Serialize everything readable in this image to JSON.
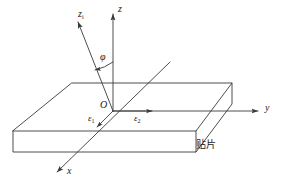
{
  "figure": {
    "kind": "3d-coordinate-slab-diagram",
    "background_color": "#ffffff",
    "line_color": "#3a3a3a",
    "text_color": "#1a1a1a"
  },
  "axes": {
    "z": {
      "label": "z",
      "subscript": "",
      "desc": "vertical axis pointing up from origin"
    },
    "zi": {
      "label": "z",
      "subscript": "i",
      "desc": "incident axis, tilted up-left from origin"
    },
    "y": {
      "label": "y",
      "subscript": "",
      "desc": "horizontal axis pointing right from origin"
    },
    "x": {
      "label": "x",
      "subscript": "",
      "desc": "oblique axis pointing down-left from origin"
    },
    "origin": {
      "label": "O"
    }
  },
  "angle": {
    "label": "φ",
    "desc": "angle between z axis and z_i axis"
  },
  "vectors": [
    {
      "name": "epsilon-1",
      "label": "ε",
      "subscript": "1",
      "desc": "arrow along x direction toward viewer-left"
    },
    {
      "name": "epsilon-2",
      "label": "ε",
      "subscript": "2",
      "desc": "arrow along y direction toward right"
    }
  ],
  "annotations": [
    {
      "name": "patch-label",
      "text": "贴片",
      "desc": "Chinese caption: patch / chip, at lower-right of slab"
    }
  ]
}
